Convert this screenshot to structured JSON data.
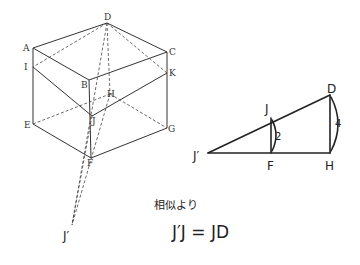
{
  "cube": {
    "labels": {
      "D": "D",
      "A": "A",
      "C": "C",
      "I": "I",
      "K": "K",
      "B": "B",
      "H": "H",
      "J": "J",
      "E": "E",
      "G": "G",
      "F": "F",
      "Jp": "J′"
    }
  },
  "triangle": {
    "labels": {
      "J": "J",
      "D": "D",
      "Jp": "J′",
      "F": "F",
      "H": "H"
    },
    "lengths": {
      "JF": "2",
      "DH": "4"
    }
  },
  "note": {
    "line1": "相似より",
    "line2": "J′J = JD"
  }
}
